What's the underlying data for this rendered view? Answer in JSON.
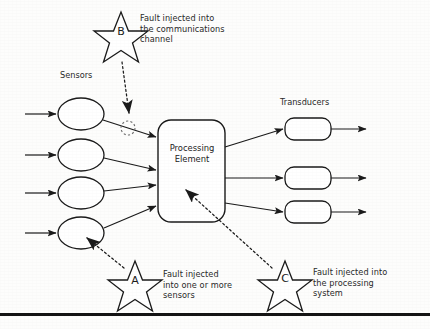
{
  "figure": {
    "background_color": "#fdfdfc",
    "stroke_color": "#1b1b1b",
    "bottom_rule_color": "#141414"
  },
  "labels": {
    "sensors": "Sensors",
    "transducers": "Transducers",
    "processing_element": "Processing\nElement"
  },
  "annotations": [
    {
      "key": "A",
      "letter": "A",
      "text": "Fault injected\ninto one or more\nsensors",
      "target": "fourth-sensor"
    },
    {
      "key": "B",
      "letter": "B",
      "text": "Fault injected into\nthe communications\nchannel",
      "target": "communication-link"
    },
    {
      "key": "C",
      "letter": "C",
      "text": "Fault injected into\nthe processing\nsystem",
      "target": "processing-element"
    }
  ],
  "nodes": {
    "sensors": [
      {
        "id": "sensor-1",
        "label": ""
      },
      {
        "id": "sensor-2",
        "label": ""
      },
      {
        "id": "sensor-3",
        "label": ""
      },
      {
        "id": "sensor-4",
        "label": ""
      }
    ],
    "processing_element": {
      "id": "processing-element",
      "label": "Processing Element"
    },
    "transducers": [
      {
        "id": "transducer-1",
        "label": ""
      },
      {
        "id": "transducer-2",
        "label": ""
      },
      {
        "id": "transducer-3",
        "label": ""
      }
    ]
  },
  "counts": {
    "sensors": 4,
    "transducers": 3,
    "inputs": 4,
    "outputs": 3
  }
}
